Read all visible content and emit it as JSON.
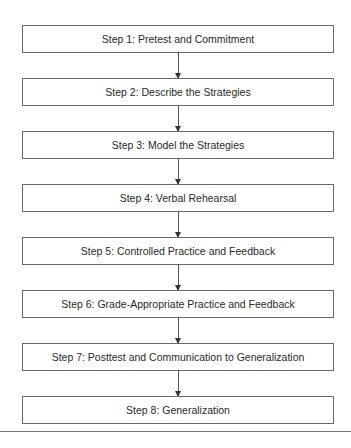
{
  "diagram": {
    "type": "flowchart",
    "direction": "top-to-bottom",
    "steps": [
      {
        "label": "Step 1: Pretest and Commitment"
      },
      {
        "label": "Step 2: Describe the Strategies"
      },
      {
        "label": "Step 3: Model the Strategies"
      },
      {
        "label": "Step 4: Verbal Rehearsal"
      },
      {
        "label": "Step 5: Controlled Practice and Feedback"
      },
      {
        "label": "Step 6: Grade-Appropriate Practice and Feedback"
      },
      {
        "label": "Step 7: Posttest and Communication to Generalization"
      },
      {
        "label": "Step 8: Generalization"
      }
    ],
    "colors": {
      "border": "#6a6a6a",
      "text": "#2a2a2a",
      "arrow": "#333333"
    }
  }
}
